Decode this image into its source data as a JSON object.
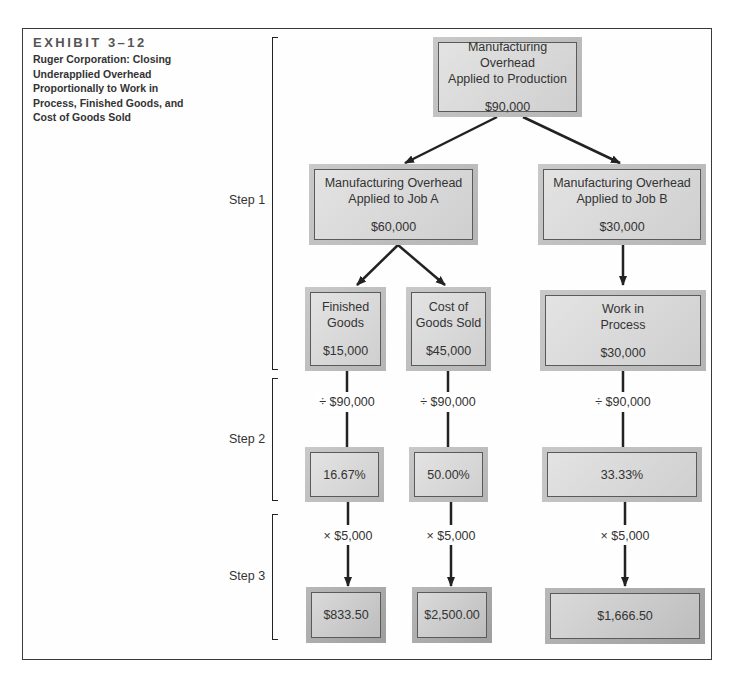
{
  "exhibit": {
    "label": "EXHIBIT 3–12",
    "title": "Ruger Corporation: Closing Underapplied Overhead Proportionally to Work in Process, Finished Goods, and Cost of Goods Sold"
  },
  "steps": [
    {
      "label": "Step 1"
    },
    {
      "label": "Step 2"
    },
    {
      "label": "Step 3"
    }
  ],
  "nodes": {
    "top": {
      "line1": "Manufacturing Overhead",
      "line2": "Applied to Production",
      "amount": "$90,000"
    },
    "job_a": {
      "line1": "Manufacturing Overhead",
      "line2": "Applied to Job A",
      "amount": "$60,000"
    },
    "job_b": {
      "line1": "Manufacturing Overhead",
      "line2": "Applied to Job B",
      "amount": "$30,000"
    },
    "finished_goods": {
      "line1": "Finished",
      "line2": "Goods",
      "amount": "$15,000"
    },
    "cogs": {
      "line1": "Cost of",
      "line2": "Goods Sold",
      "amount": "$45,000"
    },
    "wip": {
      "line1": "Work in",
      "line2": "Process",
      "amount": "$30,000"
    }
  },
  "step2": {
    "divisor_labels": [
      "÷ $90,000",
      "÷ $90,000",
      "÷ $90,000"
    ],
    "percentages": [
      "16.67%",
      "50.00%",
      "33.33%"
    ]
  },
  "step3": {
    "multiplier_labels": [
      "× $5,000",
      "× $5,000",
      "× $5,000"
    ],
    "allocations": [
      "$833.50",
      "$2,500.00",
      "$1,666.50"
    ]
  },
  "colors": {
    "border": "#3a3a3a",
    "box_fill": "#d6d6d6",
    "box_frame": "#bdbdbd",
    "arrow": "#222222"
  }
}
